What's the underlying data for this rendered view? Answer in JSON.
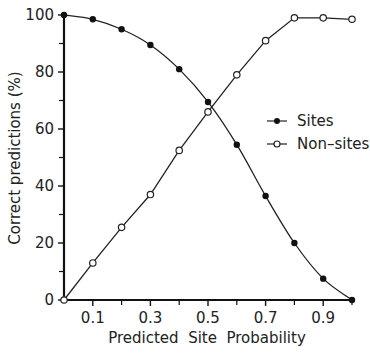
{
  "chart_data": {
    "type": "line",
    "title": "",
    "xlabel": "Predicted  Site  Probability",
    "ylabel": "Correct predictions (%)",
    "xlim": [
      0,
      1.0
    ],
    "ylim": [
      0,
      100
    ],
    "grid": false,
    "legend_position": "center-right",
    "x_ticks": [
      0.1,
      0.3,
      0.5,
      0.7,
      0.9
    ],
    "x_tick_labels": [
      "0.1",
      "0.3",
      "0.5",
      "0.7",
      "0.9"
    ],
    "x_minor_ticks": [
      0.2,
      0.4,
      0.6,
      0.8,
      1.0
    ],
    "y_ticks": [
      0,
      20,
      40,
      60,
      80,
      100
    ],
    "y_tick_labels": [
      "0",
      "20",
      "40",
      "60",
      "80",
      "100"
    ],
    "y_minor_ticks": [
      10,
      30,
      50,
      70,
      90
    ],
    "x": [
      0.0,
      0.1,
      0.2,
      0.3,
      0.4,
      0.5,
      0.6,
      0.7,
      0.8,
      0.9,
      1.0
    ],
    "series": [
      {
        "name": "Sites",
        "marker": "filled-circle",
        "smooth": true,
        "values": [
          100,
          98.5,
          95,
          89.5,
          81,
          69.5,
          54.5,
          36.5,
          20,
          7.5,
          0
        ]
      },
      {
        "name": "Non-sites",
        "marker": "open-circle",
        "smooth": false,
        "values": [
          0,
          13,
          25.5,
          37,
          52.5,
          66,
          79,
          91,
          99,
          99,
          98.5
        ]
      }
    ]
  },
  "legend": {
    "items": [
      {
        "label": "Sites"
      },
      {
        "label": "Non–sites"
      }
    ]
  },
  "axes": {
    "x_title": "Predicted  Site  Probability",
    "y_title": "Correct predictions (%)"
  }
}
